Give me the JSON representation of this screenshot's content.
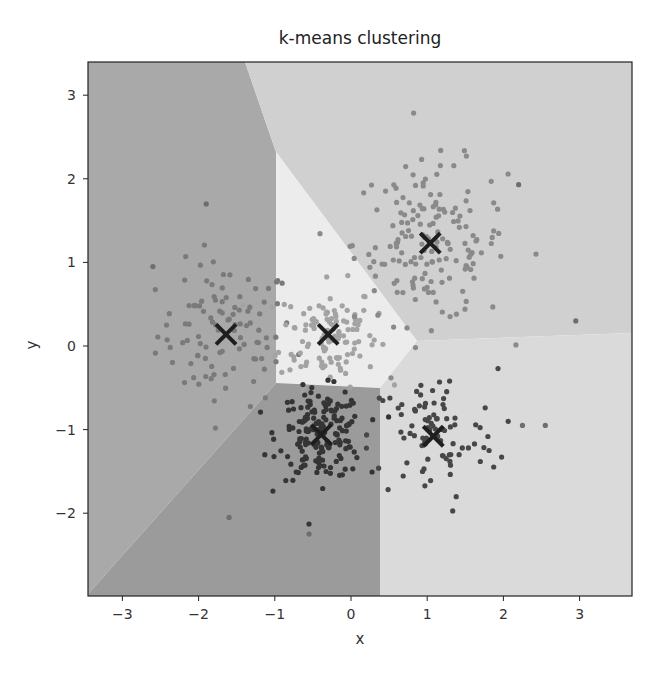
{
  "chart_data": {
    "type": "scatter",
    "title": "k-means clustering",
    "xlabel": "x",
    "ylabel": "y",
    "xlim": [
      -3.4,
      3.7
    ],
    "ylim": [
      -3.0,
      3.35
    ],
    "xticks": [
      -3,
      -2,
      -1,
      0,
      1,
      2,
      3
    ],
    "yticks": [
      -2,
      -1,
      0,
      1,
      2,
      3
    ],
    "grid": false,
    "legend": null,
    "background": "voronoi decision regions of 5 clusters (grayscale)",
    "centroids": [
      {
        "x": -1.64,
        "y": 0.14
      },
      {
        "x": -0.3,
        "y": 0.14
      },
      {
        "x": 1.04,
        "y": 1.23
      },
      {
        "x": -0.39,
        "y": -1.06
      },
      {
        "x": 1.08,
        "y": -1.08
      }
    ],
    "series": [
      {
        "name": "cluster-left",
        "center": [
          -1.64,
          0.14
        ],
        "spread": 0.45,
        "count": 100,
        "color": "#7a7a7a",
        "region_color": "#a9a9a9"
      },
      {
        "name": "cluster-center",
        "center": [
          -0.3,
          0.14
        ],
        "spread": 0.32,
        "count": 120,
        "color": "#a3a3a3",
        "region_color": "#ececec"
      },
      {
        "name": "cluster-upper-right",
        "center": [
          1.04,
          1.23
        ],
        "spread": 0.5,
        "count": 170,
        "color": "#8a8a8a",
        "region_color": "#d0d0d0"
      },
      {
        "name": "cluster-bottom-center",
        "center": [
          -0.39,
          -1.06
        ],
        "spread": 0.28,
        "count": 170,
        "color": "#353535",
        "region_color": "#9b9b9b"
      },
      {
        "name": "cluster-bottom-right",
        "center": [
          1.08,
          -1.08
        ],
        "spread": 0.42,
        "count": 90,
        "color": "#474747",
        "region_color": "#dadada"
      }
    ],
    "outliers": [
      {
        "x": -1.9,
        "y": 1.7
      },
      {
        "x": -1.6,
        "y": -2.05
      },
      {
        "x": -0.55,
        "y": -2.25
      },
      {
        "x": 2.95,
        "y": 0.3
      },
      {
        "x": 2.2,
        "y": 1.93
      },
      {
        "x": 2.55,
        "y": -0.95
      },
      {
        "x": 2.25,
        "y": -0.95
      },
      {
        "x": -2.6,
        "y": 0.95
      }
    ]
  },
  "plot": {
    "px_left": 88,
    "px_right": 632,
    "px_top": 62,
    "px_bottom": 596,
    "x0_px": 351,
    "x_unit_px": 76.2,
    "y0_px": 346,
    "y_unit_px": 83.6
  },
  "regions": [
    {
      "name": "region-left",
      "color": "#a9a9a9",
      "points": [
        [
          88,
          62
        ],
        [
          245,
          62
        ],
        [
          276,
          152
        ],
        [
          276,
          383
        ],
        [
          88,
          594
        ]
      ]
    },
    {
      "name": "region-upper-right",
      "color": "#d0d0d0",
      "points": [
        [
          245,
          62
        ],
        [
          632,
          62
        ],
        [
          632,
          333
        ],
        [
          417,
          341
        ],
        [
          276,
          152
        ]
      ]
    },
    {
      "name": "region-center",
      "color": "#ececec",
      "points": [
        [
          276,
          152
        ],
        [
          417,
          341
        ],
        [
          380,
          388
        ],
        [
          276,
          383
        ]
      ]
    },
    {
      "name": "region-bottom-center",
      "color": "#9b9b9b",
      "points": [
        [
          88,
          596
        ],
        [
          88,
          594
        ],
        [
          276,
          383
        ],
        [
          380,
          388
        ],
        [
          380,
          596
        ]
      ]
    },
    {
      "name": "region-bottom-right",
      "color": "#dadada",
      "points": [
        [
          380,
          388
        ],
        [
          417,
          341
        ],
        [
          632,
          333
        ],
        [
          632,
          596
        ],
        [
          380,
          596
        ]
      ]
    }
  ]
}
